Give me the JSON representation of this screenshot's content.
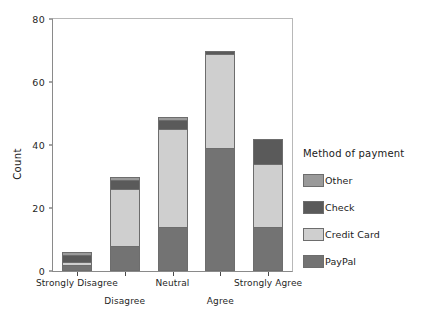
{
  "chart_data": {
    "type": "bar",
    "title": "",
    "subtitle": "",
    "stacked": true,
    "xlabel": "",
    "ylabel": "Count",
    "ylim": [
      0,
      80
    ],
    "yticks": [
      0,
      20,
      40,
      60,
      80
    ],
    "grid": false,
    "categories": [
      "Strongly Disagree",
      "Disagree",
      "Neutral",
      "Agree",
      "Strongly Agree"
    ],
    "legend_title": "Method of payment",
    "legend_position": "right",
    "series": [
      {
        "name": "PayPal",
        "color": "#737373",
        "values": [
          2,
          8,
          14,
          39,
          14
        ]
      },
      {
        "name": "Credit Card",
        "color": "#cfcfcf",
        "values": [
          1,
          18,
          31,
          30,
          20
        ]
      },
      {
        "name": "Check",
        "color": "#5a5a5a",
        "values": [
          2,
          3,
          3,
          1,
          8
        ]
      },
      {
        "name": "Other",
        "color": "#9a9a9a",
        "values": [
          1,
          1,
          1,
          0,
          0
        ]
      }
    ],
    "totals": [
      6,
      30,
      49,
      70,
      42
    ]
  },
  "axis": {
    "y_tick_labels": [
      "0",
      "20",
      "40",
      "60",
      "80"
    ],
    "y_title": "Count"
  },
  "legend": {
    "title": "Method of payment",
    "items": [
      {
        "label": "Other",
        "color": "#9a9a9a"
      },
      {
        "label": "Check",
        "color": "#5a5a5a"
      },
      {
        "label": "Credit Card",
        "color": "#cfcfcf"
      },
      {
        "label": "PayPal",
        "color": "#737373"
      }
    ]
  },
  "xaxis": {
    "labels": [
      {
        "text": "Strongly Disagree",
        "row": 1
      },
      {
        "text": "Disagree",
        "row": 2
      },
      {
        "text": "Neutral",
        "row": 1
      },
      {
        "text": "Agree",
        "row": 2
      },
      {
        "text": "Strongly Agree",
        "row": 1
      }
    ]
  }
}
